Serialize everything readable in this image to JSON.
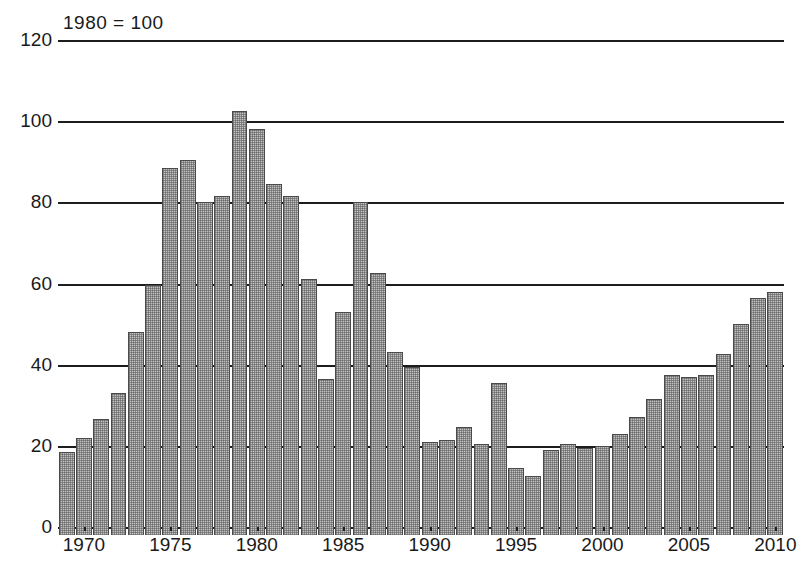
{
  "chart_data": {
    "type": "bar",
    "title": "",
    "subtitle": "",
    "annotation": "1980 = 100",
    "xlabel": "",
    "ylabel": "",
    "xlim": [
      1968.5,
      2010.5
    ],
    "ylim": [
      0,
      120
    ],
    "ytick_labels": [
      "0",
      "20",
      "40",
      "60",
      "80",
      "100",
      "120"
    ],
    "ytick_values": [
      0,
      20,
      40,
      60,
      80,
      100,
      120
    ],
    "xtick_labels": [
      "1970",
      "1975",
      "1980",
      "1985",
      "1990",
      "1995",
      "2000",
      "2005",
      "2010"
    ],
    "xtick_values": [
      1970,
      1975,
      1980,
      1985,
      1990,
      1995,
      2000,
      2005,
      2010
    ],
    "grid": true,
    "grid_axis": "y",
    "legend": false,
    "legend_position": "none",
    "bar_fill_color": "#c2c2c2",
    "bar_edge_color": "#4a4a4a",
    "axis_color": "#1d1d1d",
    "categories": [
      1969,
      1970,
      1971,
      1972,
      1973,
      1974,
      1975,
      1976,
      1977,
      1978,
      1979,
      1980,
      1981,
      1982,
      1983,
      1984,
      1985,
      1986,
      1987,
      1988,
      1989,
      1990,
      1991,
      1992,
      1993,
      1994,
      1995,
      1996,
      1997,
      1998,
      1999,
      2000,
      2001,
      2002,
      2003,
      2004,
      2005,
      2006,
      2007,
      2008,
      2009,
      2010
    ],
    "values": [
      20.5,
      24.0,
      28.5,
      35.0,
      50.0,
      61.5,
      90.5,
      92.5,
      82.0,
      83.5,
      104.5,
      100.0,
      86.5,
      83.5,
      63.0,
      38.5,
      55.0,
      82.0,
      64.5,
      45.0,
      41.5,
      23.0,
      23.5,
      26.5,
      22.5,
      37.5,
      16.5,
      14.5,
      21.0,
      22.5,
      21.5,
      22.0,
      25.0,
      29.0,
      33.5,
      39.5,
      39.0,
      39.5,
      44.5,
      52.0,
      58.5,
      60.0
    ]
  }
}
